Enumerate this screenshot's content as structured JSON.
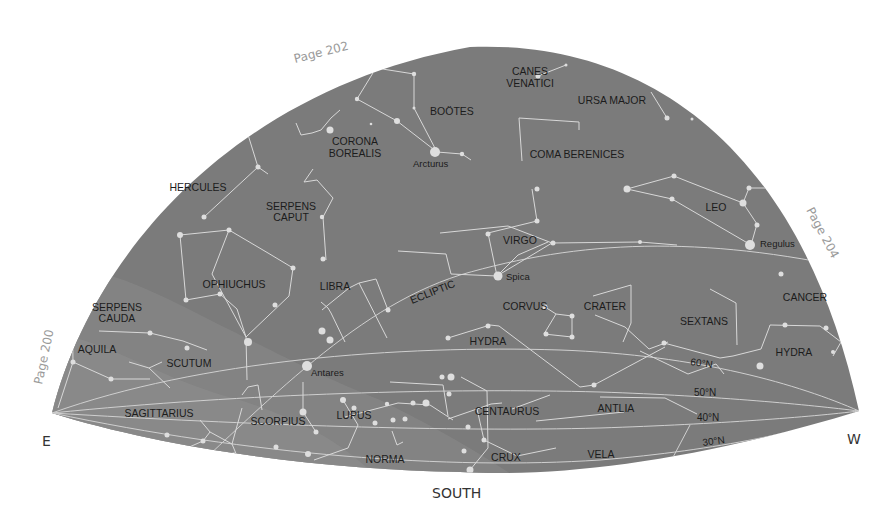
{
  "map": {
    "title": "Southern sky star chart",
    "colors": {
      "sky": "#7b7b7b",
      "milky_way": "#8a8a8a",
      "lines": "#d8d8d8",
      "stars": "#dedede",
      "page_label": "#9a9a9a"
    },
    "directions": {
      "east": "E",
      "west": "W",
      "south": "SOUTH"
    },
    "page_refs": {
      "left": "Page 200",
      "top": "Page 202",
      "right": "Page 204"
    },
    "ecliptic_label": "ECLIPTIC",
    "latitude_labels": [
      "60°N",
      "50°N",
      "40°N",
      "30°N"
    ],
    "constellations": [
      "CANES VENATICI",
      "BOÖTES",
      "URSA MAJOR",
      "CORONA BOREALIS",
      "COMA BERENICES",
      "HERCULES",
      "SERPENS CAPUT",
      "LEO",
      "VIRGO",
      "OPHIUCHUS",
      "LIBRA",
      "SERPENS CAUDA",
      "CORVUS",
      "CRATER",
      "CANCER",
      "SEXTANS",
      "AQUILA",
      "SCUTUM",
      "HYDRA",
      "HYDRA",
      "SAGITTARIUS",
      "SCORPIUS",
      "LUPUS",
      "CENTAURUS",
      "ANTLIA",
      "NORMA",
      "CRUX",
      "VELA"
    ],
    "labels": {
      "canes1": "CANES",
      "canes2": "VENATICI",
      "bootes": "BOÖTES",
      "ursa": "URSA MAJOR",
      "corona1": "CORONA",
      "corona2": "BOREALIS",
      "coma": "COMA BERENICES",
      "hercules": "HERCULES",
      "serpcap1": "SERPENS",
      "serpcap2": "CAPUT",
      "leo": "LEO",
      "virgo": "VIRGO",
      "ophiuchus": "OPHIUCHUS",
      "libra": "LIBRA",
      "serpcau1": "SERPENS",
      "serpcau2": "CAUDA",
      "corvus": "CORVUS",
      "crater": "CRATER",
      "cancer": "CANCER",
      "sextans": "SEXTANS",
      "aquila": "AQUILA",
      "scutum": "SCUTUM",
      "hydra1": "HYDRA",
      "hydra2": "HYDRA",
      "sagittarius": "SAGITTARIUS",
      "scorpius": "SCORPIUS",
      "lupus": "LUPUS",
      "centaurus": "CENTAURUS",
      "antlia": "ANTLIA",
      "norma": "NORMA",
      "crux": "CRUX",
      "vela": "VELA"
    },
    "stars": {
      "arcturus": "Arcturus",
      "regulus": "Regulus",
      "spica": "Spica",
      "antares": "Antares"
    }
  }
}
